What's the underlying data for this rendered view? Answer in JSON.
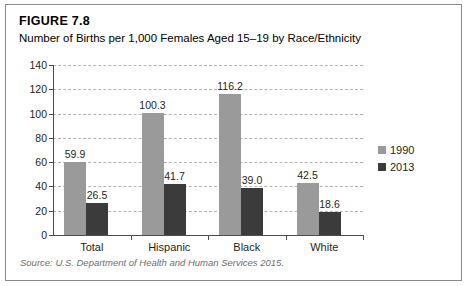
{
  "figure": {
    "number": "FIGURE 7.8",
    "title": "Number of Births per 1,000 Females Aged 15–19 by Race/Ethnicity",
    "source": "Source: U.S. Department of Health and Human Services 2015."
  },
  "colors": {
    "series_1990": "#9a9a9a",
    "series_2013": "#3b3b3b",
    "gridline": "#b4b4b4",
    "axis": "#4d4d4d",
    "border": "#8a8a8a",
    "text": "#231f20",
    "source_text": "#6e6e6e"
  },
  "chart_data": {
    "type": "bar",
    "title": "Number of Births per 1,000 Females Aged 15–19 by Race/Ethnicity",
    "subtitle": "FIGURE 7.8",
    "xlabel": "",
    "ylabel": "",
    "categories": [
      "Total",
      "Hispanic",
      "Black",
      "White"
    ],
    "series": [
      {
        "name": "1990",
        "color": "#9a9a9a",
        "values": [
          59.9,
          100.3,
          116.2,
          42.5
        ],
        "labels": [
          "59.9",
          "100.3",
          "116.2",
          "42.5"
        ]
      },
      {
        "name": "2013",
        "color": "#3b3b3b",
        "values": [
          26.5,
          41.7,
          39.0,
          18.6
        ],
        "labels": [
          "26.5",
          "41.7",
          "39.0",
          "18.6"
        ]
      }
    ],
    "ylim": [
      0,
      140
    ],
    "yticks": [
      0,
      20,
      40,
      60,
      80,
      100,
      120,
      140
    ],
    "ytick_labels": [
      "0",
      "20",
      "40",
      "60",
      "80",
      "100",
      "120",
      "140"
    ],
    "grid": true,
    "grid_axis": "y",
    "legend_position": "right",
    "data_labels": true,
    "source": "Source: U.S. Department of Health and Human Services 2015."
  }
}
